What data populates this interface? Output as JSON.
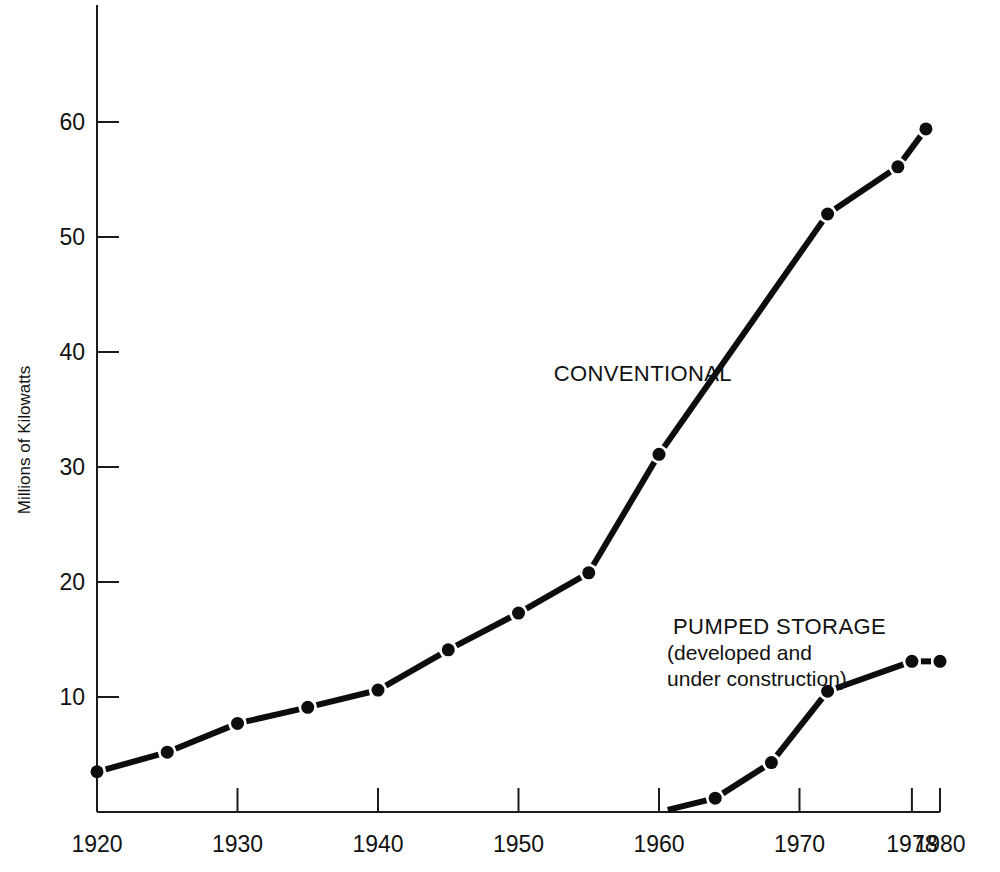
{
  "chart_data": {
    "type": "line",
    "title": "",
    "xlabel": "",
    "ylabel": "Millions of Kilowatts",
    "xlim": [
      1920,
      1980
    ],
    "ylim": [
      0,
      65
    ],
    "grid": false,
    "legend_position": "inline-annotations",
    "x_ticks": [
      "1920",
      "1930",
      "1940",
      "1950",
      "1960",
      "1970",
      "1978",
      "1980"
    ],
    "x_tick_values": [
      1920,
      1930,
      1940,
      1950,
      1960,
      1970,
      1978,
      1980
    ],
    "y_ticks": [
      "10",
      "20",
      "30",
      "40",
      "50",
      "60"
    ],
    "y_tick_values": [
      10,
      20,
      30,
      40,
      50,
      60
    ],
    "series": [
      {
        "name": "CONVENTIONAL",
        "annotation": "CONVENTIONAL",
        "annotation_x": 1952.5,
        "annotation_y": 37.5,
        "x": [
          1920,
          1925,
          1930,
          1935,
          1940,
          1945,
          1950,
          1955,
          1960,
          1972,
          1977,
          1979
        ],
        "values": [
          3.5,
          5.2,
          7.7,
          9.1,
          10.6,
          14.1,
          17.3,
          20.8,
          31.1,
          52.0,
          56.1,
          59.4
        ]
      },
      {
        "name": "PUMPED STORAGE",
        "annotation": "PUMPED STORAGE",
        "annotation_line2": "(developed and",
        "annotation_line3": "under construction)",
        "annotation_x": 1961.0,
        "annotation_y": 15.5,
        "x": [
          1960,
          1964,
          1968,
          1972,
          1978,
          1980
        ],
        "values": [
          0.0,
          1.2,
          4.3,
          10.5,
          13.1,
          13.1
        ]
      }
    ],
    "colors": {
      "line": "#0d0d0d",
      "axis": "#1b1b1b",
      "background": "#ffffff"
    }
  }
}
